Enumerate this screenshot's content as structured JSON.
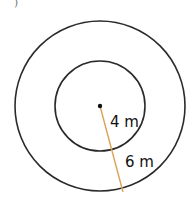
{
  "figure": {
    "part_marker": ")",
    "inner_radius_label": "4 m",
    "ring_width_label": "6 m",
    "colors": {
      "circle_stroke": "#2a2a2a",
      "radius_line": "#d9a35a",
      "text": "#111111"
    }
  }
}
